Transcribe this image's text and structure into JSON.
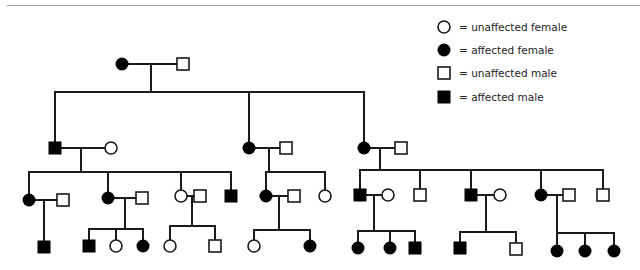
{
  "legend": {
    "items": [
      {
        "symbol": "circle-open",
        "label": "= unaffected female"
      },
      {
        "symbol": "circle-filled",
        "label": "= affected female"
      },
      {
        "symbol": "square-open",
        "label": "= unaffected male"
      },
      {
        "symbol": "square-filled",
        "label": "= affected male"
      }
    ]
  },
  "colors": {
    "line": "#1a1a1a",
    "fill_affected": "#000000",
    "fill_unaffected": "#ffffff",
    "rule": "#9a9a9a"
  },
  "pedigree": {
    "individuals": [
      {
        "id": "I-1",
        "sex": "female",
        "affected": true,
        "x": 122,
        "y": 64
      },
      {
        "id": "I-2",
        "sex": "male",
        "affected": false,
        "x": 183,
        "y": 64
      },
      {
        "id": "II-1",
        "sex": "male",
        "affected": true,
        "x": 55,
        "y": 148
      },
      {
        "id": "II-1s",
        "sex": "female",
        "affected": false,
        "x": 111,
        "y": 148
      },
      {
        "id": "II-2",
        "sex": "female",
        "affected": true,
        "x": 249,
        "y": 148
      },
      {
        "id": "II-2s",
        "sex": "male",
        "affected": false,
        "x": 286,
        "y": 148
      },
      {
        "id": "II-3",
        "sex": "female",
        "affected": true,
        "x": 364,
        "y": 148
      },
      {
        "id": "II-3s",
        "sex": "male",
        "affected": false,
        "x": 401,
        "y": 148
      },
      {
        "id": "III-1",
        "sex": "female",
        "affected": true,
        "x": 29,
        "y": 200
      },
      {
        "id": "III-1s",
        "sex": "male",
        "affected": false,
        "x": 63,
        "y": 200
      },
      {
        "id": "III-2",
        "sex": "female",
        "affected": true,
        "x": 108,
        "y": 198
      },
      {
        "id": "III-2s",
        "sex": "male",
        "affected": false,
        "x": 142,
        "y": 198
      },
      {
        "id": "III-3",
        "sex": "female",
        "affected": false,
        "x": 181,
        "y": 196
      },
      {
        "id": "III-3s",
        "sex": "male",
        "affected": false,
        "x": 200,
        "y": 196
      },
      {
        "id": "III-4",
        "sex": "male",
        "affected": true,
        "x": 231,
        "y": 196
      },
      {
        "id": "III-5",
        "sex": "female",
        "affected": true,
        "x": 266,
        "y": 196
      },
      {
        "id": "III-5s",
        "sex": "male",
        "affected": false,
        "x": 294,
        "y": 196
      },
      {
        "id": "III-6",
        "sex": "female",
        "affected": false,
        "x": 325,
        "y": 196
      },
      {
        "id": "III-7",
        "sex": "male",
        "affected": true,
        "x": 360,
        "y": 195
      },
      {
        "id": "III-7s",
        "sex": "female",
        "affected": false,
        "x": 388,
        "y": 195
      },
      {
        "id": "III-8",
        "sex": "male",
        "affected": false,
        "x": 420,
        "y": 195
      },
      {
        "id": "III-9",
        "sex": "male",
        "affected": true,
        "x": 471,
        "y": 195
      },
      {
        "id": "III-9s",
        "sex": "female",
        "affected": false,
        "x": 500,
        "y": 195
      },
      {
        "id": "III-10",
        "sex": "female",
        "affected": true,
        "x": 541,
        "y": 195
      },
      {
        "id": "III-10s",
        "sex": "male",
        "affected": false,
        "x": 569,
        "y": 195
      },
      {
        "id": "III-11",
        "sex": "male",
        "affected": false,
        "x": 603,
        "y": 195
      },
      {
        "id": "IV-1",
        "sex": "male",
        "affected": true,
        "x": 44,
        "y": 247
      },
      {
        "id": "IV-2",
        "sex": "male",
        "affected": true,
        "x": 89,
        "y": 246
      },
      {
        "id": "IV-3",
        "sex": "female",
        "affected": false,
        "x": 116,
        "y": 246
      },
      {
        "id": "IV-4",
        "sex": "female",
        "affected": true,
        "x": 143,
        "y": 246
      },
      {
        "id": "IV-5",
        "sex": "female",
        "affected": false,
        "x": 170,
        "y": 246
      },
      {
        "id": "IV-6",
        "sex": "male",
        "affected": false,
        "x": 215,
        "y": 246
      },
      {
        "id": "IV-7",
        "sex": "female",
        "affected": false,
        "x": 254,
        "y": 246
      },
      {
        "id": "IV-8",
        "sex": "female",
        "affected": true,
        "x": 310,
        "y": 246
      },
      {
        "id": "IV-9",
        "sex": "female",
        "affected": true,
        "x": 358,
        "y": 248
      },
      {
        "id": "IV-10",
        "sex": "female",
        "affected": true,
        "x": 390,
        "y": 248
      },
      {
        "id": "IV-11",
        "sex": "male",
        "affected": true,
        "x": 415,
        "y": 248
      },
      {
        "id": "IV-12",
        "sex": "male",
        "affected": true,
        "x": 460,
        "y": 248
      },
      {
        "id": "IV-13",
        "sex": "male",
        "affected": false,
        "x": 516,
        "y": 249
      },
      {
        "id": "IV-14",
        "sex": "female",
        "affected": true,
        "x": 557,
        "y": 251
      },
      {
        "id": "IV-15",
        "sex": "female",
        "affected": true,
        "x": 585,
        "y": 251
      },
      {
        "id": "IV-16",
        "sex": "female",
        "affected": true,
        "x": 614,
        "y": 251
      }
    ],
    "lines": [
      [
        128,
        64,
        177,
        64
      ],
      [
        151,
        64,
        151,
        92
      ],
      [
        55,
        92,
        364,
        92
      ],
      [
        55,
        92,
        55,
        142
      ],
      [
        249,
        92,
        249,
        142
      ],
      [
        364,
        92,
        364,
        142
      ],
      [
        61,
        148,
        105,
        148
      ],
      [
        81,
        148,
        81,
        172
      ],
      [
        29,
        172,
        231,
        172
      ],
      [
        29,
        172,
        29,
        194
      ],
      [
        108,
        172,
        108,
        192
      ],
      [
        181,
        172,
        181,
        190
      ],
      [
        231,
        172,
        231,
        190
      ],
      [
        255,
        148,
        280,
        148
      ],
      [
        269,
        148,
        269,
        172
      ],
      [
        266,
        172,
        325,
        172
      ],
      [
        266,
        172,
        266,
        190
      ],
      [
        325,
        172,
        325,
        190
      ],
      [
        370,
        148,
        395,
        148
      ],
      [
        380,
        148,
        380,
        170
      ],
      [
        360,
        170,
        603,
        170
      ],
      [
        360,
        170,
        360,
        189
      ],
      [
        420,
        170,
        420,
        189
      ],
      [
        471,
        170,
        471,
        189
      ],
      [
        541,
        170,
        541,
        189
      ],
      [
        603,
        170,
        603,
        189
      ],
      [
        35,
        200,
        57,
        200
      ],
      [
        44,
        200,
        44,
        241
      ],
      [
        114,
        198,
        136,
        198
      ],
      [
        125,
        198,
        125,
        229
      ],
      [
        89,
        229,
        143,
        229
      ],
      [
        89,
        229,
        89,
        240
      ],
      [
        116,
        229,
        116,
        240
      ],
      [
        143,
        229,
        143,
        240
      ],
      [
        187,
        196,
        194,
        196
      ],
      [
        192,
        196,
        192,
        226
      ],
      [
        170,
        226,
        215,
        226
      ],
      [
        170,
        226,
        170,
        240
      ],
      [
        215,
        226,
        215,
        240
      ],
      [
        272,
        196,
        288,
        196
      ],
      [
        279,
        196,
        279,
        230
      ],
      [
        254,
        230,
        310,
        230
      ],
      [
        254,
        230,
        254,
        240
      ],
      [
        310,
        230,
        310,
        240
      ],
      [
        366,
        195,
        382,
        195
      ],
      [
        374,
        195,
        374,
        231
      ],
      [
        358,
        231,
        415,
        231
      ],
      [
        358,
        231,
        358,
        242
      ],
      [
        390,
        231,
        390,
        242
      ],
      [
        415,
        231,
        415,
        242
      ],
      [
        477,
        195,
        494,
        195
      ],
      [
        486,
        195,
        486,
        232
      ],
      [
        460,
        232,
        516,
        232
      ],
      [
        460,
        232,
        460,
        242
      ],
      [
        516,
        232,
        516,
        243
      ],
      [
        547,
        195,
        563,
        195
      ],
      [
        557,
        195,
        557,
        233
      ],
      [
        557,
        233,
        614,
        233
      ],
      [
        557,
        233,
        557,
        245
      ],
      [
        585,
        233,
        585,
        245
      ],
      [
        614,
        233,
        614,
        245
      ]
    ]
  }
}
